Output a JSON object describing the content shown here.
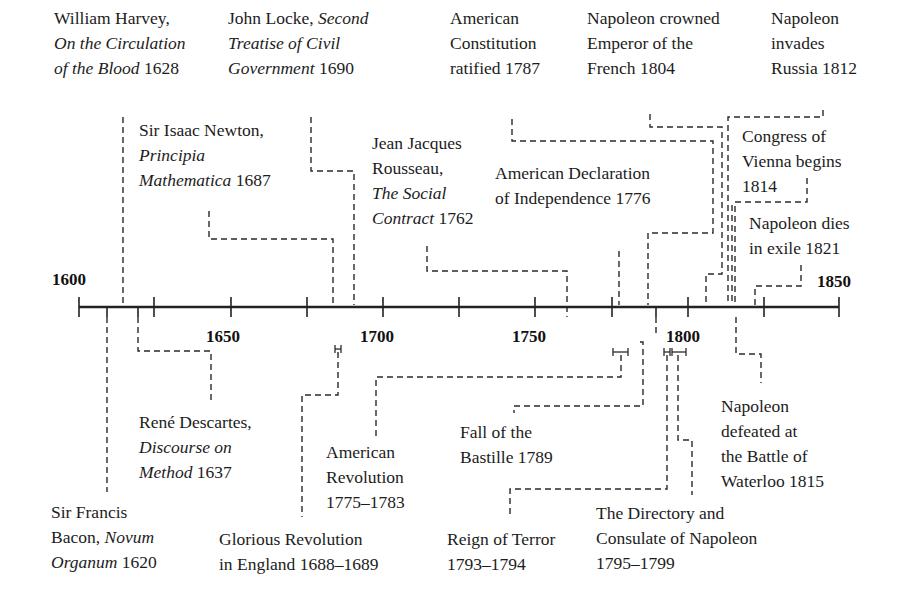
{
  "axis": {
    "start_label": "1600",
    "end_label": "1850",
    "tick_labels": [
      "1650",
      "1700",
      "1750",
      "1800"
    ],
    "y": 307,
    "x_start": 79,
    "x_end": 839,
    "major_ticks_x": [
      79,
      154,
      231,
      307,
      383,
      459,
      535,
      612,
      688,
      764,
      839
    ],
    "minor_marks_below_x": [
      107,
      138,
      656
    ],
    "minor_marks_above_x": [
      123,
      606
    ]
  },
  "events_above": [
    {
      "id": "harvey",
      "parts": [
        {
          "t": "William Harvey,"
        },
        {
          "br": 1
        },
        {
          "t": "On the Circulation",
          "i": 1
        },
        {
          "br": 1
        },
        {
          "t": "of the Blood",
          "i": 1
        },
        {
          "t": " 1628"
        }
      ],
      "x": 54,
      "y": 6
    },
    {
      "id": "locke",
      "parts": [
        {
          "t": "John Locke,  "
        },
        {
          "t": "Second",
          "i": 1
        },
        {
          "br": 1
        },
        {
          "t": "Treatise of Civil",
          "i": 1
        },
        {
          "br": 1
        },
        {
          "t": "Government",
          "i": 1
        },
        {
          "t": " 1690"
        }
      ],
      "x": 228,
      "y": 6
    },
    {
      "id": "constitution",
      "parts": [
        {
          "t": "American"
        },
        {
          "br": 1
        },
        {
          "t": "Constitution"
        },
        {
          "br": 1
        },
        {
          "t": "ratified 1787"
        }
      ],
      "x": 450,
      "y": 6
    },
    {
      "id": "crowned",
      "parts": [
        {
          "t": "Napoleon crowned"
        },
        {
          "br": 1
        },
        {
          "t": "Emperor of the"
        },
        {
          "br": 1
        },
        {
          "t": "French 1804"
        }
      ],
      "x": 587,
      "y": 6
    },
    {
      "id": "russia",
      "parts": [
        {
          "t": "Napoleon"
        },
        {
          "br": 1
        },
        {
          "t": "invades"
        },
        {
          "br": 1
        },
        {
          "t": "Russia 1812"
        }
      ],
      "x": 771,
      "y": 6
    },
    {
      "id": "newton",
      "parts": [
        {
          "t": "Sir Isaac Newton,"
        },
        {
          "br": 1
        },
        {
          "t": "Principia",
          "i": 1
        },
        {
          "br": 1
        },
        {
          "t": "Mathematica",
          "i": 1
        },
        {
          "t": " 1687"
        }
      ],
      "x": 139,
      "y": 118
    },
    {
      "id": "rousseau",
      "parts": [
        {
          "t": "Jean Jacques"
        },
        {
          "br": 1
        },
        {
          "t": "Rousseau,"
        },
        {
          "br": 1
        },
        {
          "t": "The Social",
          "i": 1
        },
        {
          "br": 1
        },
        {
          "t": "Contract",
          "i": 1
        },
        {
          "t": " 1762"
        }
      ],
      "x": 372,
      "y": 131
    },
    {
      "id": "declaration",
      "parts": [
        {
          "t": "American Declaration"
        },
        {
          "br": 1
        },
        {
          "t": "of Independence 1776"
        }
      ],
      "x": 495,
      "y": 161
    },
    {
      "id": "congress",
      "parts": [
        {
          "t": "Congress of"
        },
        {
          "br": 1
        },
        {
          "t": "Vienna begins"
        },
        {
          "br": 1
        },
        {
          "t": "1814"
        }
      ],
      "x": 742,
      "y": 124
    },
    {
      "id": "napdies",
      "parts": [
        {
          "t": "Napoleon dies"
        },
        {
          "br": 1
        },
        {
          "t": "in exile 1821"
        }
      ],
      "x": 749,
      "y": 211
    }
  ],
  "events_below": [
    {
      "id": "bacon",
      "parts": [
        {
          "t": "Sir Francis"
        },
        {
          "br": 1
        },
        {
          "t": "Bacon,  "
        },
        {
          "t": "Novum",
          "i": 1
        },
        {
          "br": 1
        },
        {
          "t": "Organum",
          "i": 1
        },
        {
          "t": " 1620"
        }
      ],
      "x": 51,
      "y": 500
    },
    {
      "id": "descartes",
      "parts": [
        {
          "t": "René Descartes,"
        },
        {
          "br": 1
        },
        {
          "t": "Discourse on",
          "i": 1
        },
        {
          "br": 1
        },
        {
          "t": "Method",
          "i": 1
        },
        {
          "t": " 1637"
        }
      ],
      "x": 139,
      "y": 410
    },
    {
      "id": "glorious",
      "parts": [
        {
          "t": "Glorious Revolution"
        },
        {
          "br": 1
        },
        {
          "t": "in England 1688–1689"
        }
      ],
      "x": 219,
      "y": 527
    },
    {
      "id": "amrev",
      "parts": [
        {
          "t": "American"
        },
        {
          "br": 1
        },
        {
          "t": "Revolution"
        },
        {
          "br": 1
        },
        {
          "t": "1775–1783"
        }
      ],
      "x": 326,
      "y": 440
    },
    {
      "id": "bastille",
      "parts": [
        {
          "t": "Fall of the"
        },
        {
          "br": 1
        },
        {
          "t": "Bastille 1789"
        }
      ],
      "x": 460,
      "y": 420
    },
    {
      "id": "terror",
      "parts": [
        {
          "t": "Reign of Terror"
        },
        {
          "br": 1
        },
        {
          "t": "1793–1794"
        }
      ],
      "x": 447,
      "y": 527
    },
    {
      "id": "directory",
      "parts": [
        {
          "t": "The Directory and"
        },
        {
          "br": 1
        },
        {
          "t": "Consulate of Napoleon"
        },
        {
          "br": 1
        },
        {
          "t": "1795–1799"
        }
      ],
      "x": 596,
      "y": 501
    },
    {
      "id": "waterloo",
      "parts": [
        {
          "t": "Napoleon"
        },
        {
          "br": 1
        },
        {
          "t": "defeated at"
        },
        {
          "br": 1
        },
        {
          "t": "the Battle of"
        },
        {
          "br": 1
        },
        {
          "t": "Waterloo 1815"
        }
      ],
      "x": 721,
      "y": 394
    }
  ],
  "connectors": [
    {
      "id": "harvey",
      "d": "M123 117 V305"
    },
    {
      "id": "locke",
      "d": "M311 117 V171 H354 V305"
    },
    {
      "id": "newton",
      "d": "M209 211 V239 H333 V305"
    },
    {
      "id": "rousseau",
      "d": "M427 246 V271 H567 V317"
    },
    {
      "id": "constitution",
      "d": "M512 119 V141 H713 V233 H648 V305"
    },
    {
      "id": "declaration",
      "d": "M619 251 V305"
    },
    {
      "id": "crowned",
      "d": "M650 114 V127 H722 V274 H706 V305"
    },
    {
      "id": "russia",
      "d": "M823 110 V117 H728 V305"
    },
    {
      "id": "congress",
      "d": "M807 178 V202 H735 V305"
    },
    {
      "id": "congress2",
      "d": "M732 205 V305"
    },
    {
      "id": "napdies",
      "d": "M801 265 V286 H755 V305"
    },
    {
      "id": "bacon",
      "d": "M107 317 V492"
    },
    {
      "id": "descartes",
      "d": "M138 317 V351 H211 V404"
    },
    {
      "id": "glorious",
      "d": "M338 352 V395 H302 V517"
    },
    {
      "id": "amrev",
      "d": "M621 355 V377 H376 V437"
    },
    {
      "id": "bastille",
      "d": "M640 342 H643 V406 H514 V413"
    },
    {
      "id": "terror",
      "d": "M656 317 V337 M667 355 V489 H510 V517"
    },
    {
      "id": "directory",
      "d": "M678 355 V440 H692 V495"
    },
    {
      "id": "waterloo",
      "d": "M736 317 V354 H761 V383"
    }
  ],
  "brackets": [
    {
      "id": "glorious",
      "x1": 335,
      "x2": 341,
      "y": 349
    },
    {
      "id": "amrev",
      "x1": 613,
      "x2": 628,
      "y": 352
    },
    {
      "id": "terror",
      "x1": 664,
      "x2": 670,
      "y": 352
    },
    {
      "id": "directory",
      "x1": 672,
      "x2": 686,
      "y": 352
    }
  ]
}
